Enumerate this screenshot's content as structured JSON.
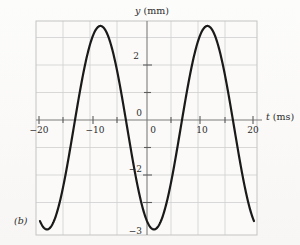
{
  "figure": {
    "panel_label": "(b)",
    "background_color": "#faf9f7",
    "curve_color": "#1a1a1a",
    "grid_color": "#cfcfcf",
    "axis_color": "#8a8a8a",
    "frame_color": "#c4c4c4",
    "text_color": "#2b2b2b"
  },
  "chart_data": {
    "type": "line",
    "title": "",
    "xlabel_symbol": "t",
    "xlabel_unit": "(ms)",
    "ylabel_symbol": "y",
    "ylabel_unit": "(mm)",
    "xlim": [
      -20,
      20
    ],
    "ylim": [
      -4.2,
      3.8
    ],
    "grid": true,
    "grid_x_step": 5,
    "grid_y_step": 1,
    "legend": "none",
    "x_ticks": [
      -20,
      -10,
      0,
      10,
      20
    ],
    "x_tick_labels": [
      "−20",
      "−10",
      "0",
      "10",
      "20"
    ],
    "y_ticks": [
      2,
      0,
      -2,
      -3
    ],
    "y_tick_labels": [
      "2",
      "0",
      "−2",
      "−3"
    ],
    "waveform": {
      "form": "sinusoid",
      "amplitude_mm": 3.7,
      "period_ms": 20,
      "offset_mm": -0.28,
      "phase_peak_times_ms": [
        -8.7,
        11.3
      ],
      "phase_trough_times_ms": [
        -18.3,
        1.7
      ],
      "peak_value_mm": 3.45,
      "trough_value_mm": -4.0,
      "zero_crossings_ms": [
        -13.5,
        -3.6,
        6.5,
        16.4
      ]
    },
    "series": [
      {
        "name": "y(t)",
        "x": [
          -20,
          -19,
          -18,
          -17,
          -16,
          -15,
          -14,
          -13,
          -12,
          -11,
          -10,
          -9,
          -8,
          -7,
          -6,
          -5,
          -4,
          -3,
          -2,
          -1,
          0,
          1,
          2,
          3,
          4,
          5,
          6,
          7,
          8,
          9,
          10,
          11,
          12,
          13,
          14,
          15,
          16,
          17,
          18,
          19,
          20
        ],
        "y": [
          -2.07,
          -3.26,
          -3.87,
          -3.92,
          -3.39,
          -2.36,
          -0.98,
          0.55,
          2.0,
          3.07,
          3.6,
          3.53,
          2.88,
          1.76,
          0.36,
          -1.1,
          -2.4,
          -3.33,
          -3.83,
          -3.86,
          -3.41,
          -2.55,
          -1.32,
          0.11,
          1.54,
          2.7,
          3.4,
          3.56,
          3.16,
          2.22,
          0.9,
          -0.58,
          -2.02,
          -3.12,
          -3.75,
          -3.85,
          -3.4,
          -2.48,
          -1.18,
          0.3,
          1.72
        ]
      }
    ]
  }
}
